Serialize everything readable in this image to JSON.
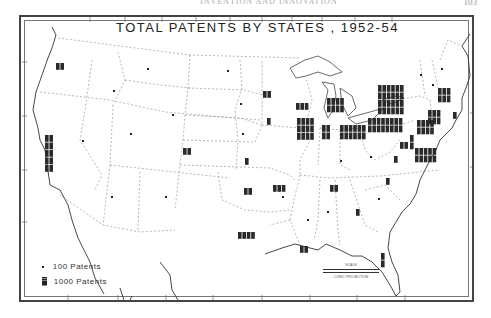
{
  "page": {
    "page_number": "103",
    "running_head": "INVENTION AND INNOVATION"
  },
  "map": {
    "title": "TOTAL PATENTS BY STATES , 1952-54",
    "projection": "CONIC PROJECTION",
    "scale_label": "SCALE",
    "legend": [
      {
        "symbol": "small-square",
        "label": "100 Patents"
      },
      {
        "symbol": "large-block",
        "label": "1000 Patents"
      }
    ],
    "bottom_label": "WEST LONGITUDE"
  },
  "state_symbols": [
    {
      "region": "Washington",
      "x": 56,
      "y": 63,
      "cols": 2,
      "rows": 3
    },
    {
      "region": "California",
      "x": 45,
      "y": 135,
      "cols": 2,
      "rows": 15
    },
    {
      "region": "Oregon",
      "x": 40,
      "y": 95,
      "cols": 0,
      "rows": 0
    },
    {
      "region": "Idaho",
      "x": 113,
      "y": 90,
      "cols": 1,
      "rows": 1
    },
    {
      "region": "Montana",
      "x": 147,
      "y": 68,
      "cols": 1,
      "rows": 1
    },
    {
      "region": "Wyoming",
      "x": 172,
      "y": 114,
      "cols": 1,
      "rows": 1
    },
    {
      "region": "Nevada",
      "x": 82,
      "y": 140,
      "cols": 1,
      "rows": 1
    },
    {
      "region": "Utah",
      "x": 130,
      "y": 133,
      "cols": 1,
      "rows": 1
    },
    {
      "region": "Colorado",
      "x": 183,
      "y": 148,
      "cols": 2,
      "rows": 2
    },
    {
      "region": "Arizona",
      "x": 111,
      "y": 196,
      "cols": 1,
      "rows": 1
    },
    {
      "region": "New Mexico",
      "x": 165,
      "y": 196,
      "cols": 1,
      "rows": 1
    },
    {
      "region": "North Dakota",
      "x": 227,
      "y": 70,
      "cols": 1,
      "rows": 1
    },
    {
      "region": "South Dakota",
      "x": 240,
      "y": 103,
      "cols": 1,
      "rows": 1
    },
    {
      "region": "Nebraska",
      "x": 242,
      "y": 133,
      "cols": 1,
      "rows": 1
    },
    {
      "region": "Kansas",
      "x": 245,
      "y": 158,
      "cols": 1,
      "rows": 2
    },
    {
      "region": "Oklahoma",
      "x": 244,
      "y": 188,
      "cols": 2,
      "rows": 3
    },
    {
      "region": "Texas",
      "x": 238,
      "y": 232,
      "cols": 4,
      "rows": 3
    },
    {
      "region": "Minnesota",
      "x": 263,
      "y": 91,
      "cols": 2,
      "rows": 3
    },
    {
      "region": "Iowa",
      "x": 267,
      "y": 118,
      "cols": 1,
      "rows": 3
    },
    {
      "region": "Missouri",
      "x": 273,
      "y": 185,
      "cols": 3,
      "rows": 3
    },
    {
      "region": "Wisconsin",
      "x": 296,
      "y": 103,
      "cols": 3,
      "rows": 3
    },
    {
      "region": "Illinois",
      "x": 297,
      "y": 118,
      "cols": 4,
      "rows": 8
    },
    {
      "region": "Michigan",
      "x": 327,
      "y": 98,
      "cols": 4,
      "rows": 5
    },
    {
      "region": "Indiana",
      "x": 322,
      "y": 125,
      "cols": 2,
      "rows": 4
    },
    {
      "region": "Ohio",
      "x": 340,
      "y": 125,
      "cols": 6,
      "rows": 6
    },
    {
      "region": "Kentucky",
      "x": 340,
      "y": 160,
      "cols": 1,
      "rows": 1
    },
    {
      "region": "Tennessee",
      "x": 330,
      "y": 185,
      "cols": 2,
      "rows": 2
    },
    {
      "region": "Arkansas",
      "x": 282,
      "y": 196,
      "cols": 1,
      "rows": 1
    },
    {
      "region": "Louisiana",
      "x": 300,
      "y": 246,
      "cols": 2,
      "rows": 2
    },
    {
      "region": "Mississippi",
      "x": 307,
      "y": 219,
      "cols": 1,
      "rows": 1
    },
    {
      "region": "Alabama",
      "x": 327,
      "y": 211,
      "cols": 1,
      "rows": 1
    },
    {
      "region": "Georgia",
      "x": 356,
      "y": 209,
      "cols": 1,
      "rows": 2
    },
    {
      "region": "South Carolina",
      "x": 378,
      "y": 198,
      "cols": 1,
      "rows": 1
    },
    {
      "region": "North Carolina",
      "x": 386,
      "y": 178,
      "cols": 1,
      "rows": 2
    },
    {
      "region": "Florida",
      "x": 381,
      "y": 253,
      "cols": 1,
      "rows": 4
    },
    {
      "region": "West Virginia",
      "x": 370,
      "y": 156,
      "cols": 1,
      "rows": 1
    },
    {
      "region": "Virginia",
      "x": 394,
      "y": 156,
      "cols": 1,
      "rows": 2
    },
    {
      "region": "Pennsylvania",
      "x": 368,
      "y": 118,
      "cols": 8,
      "rows": 6
    },
    {
      "region": "New York",
      "x": 378,
      "y": 85,
      "cols": 6,
      "rows": 10
    },
    {
      "region": "New Jersey",
      "x": 417,
      "y": 120,
      "cols": 4,
      "rows": 6
    },
    {
      "region": "Maryland",
      "x": 400,
      "y": 142,
      "cols": 2,
      "rows": 2
    },
    {
      "region": "Delaware",
      "x": 410,
      "y": 135,
      "cols": 1,
      "rows": 4
    },
    {
      "region": "Connecticut",
      "x": 428,
      "y": 110,
      "cols": 3,
      "rows": 6
    },
    {
      "region": "Massachusetts",
      "x": 438,
      "y": 88,
      "cols": 3,
      "rows": 6
    },
    {
      "region": "Vermont",
      "x": 420,
      "y": 74,
      "cols": 1,
      "rows": 1
    },
    {
      "region": "New Hampshire",
      "x": 432,
      "y": 84,
      "cols": 1,
      "rows": 1
    },
    {
      "region": "Maine",
      "x": 441,
      "y": 68,
      "cols": 1,
      "rows": 1
    },
    {
      "region": "Rhode Island",
      "x": 453,
      "y": 112,
      "cols": 1,
      "rows": 3
    },
    {
      "region": "Mid-Atlantic block",
      "x": 415,
      "y": 148,
      "cols": 5,
      "rows": 6
    }
  ],
  "colors": {
    "ink": "#222222",
    "border": "#444444",
    "paper": "#ffffff",
    "boundary": "#888888"
  }
}
